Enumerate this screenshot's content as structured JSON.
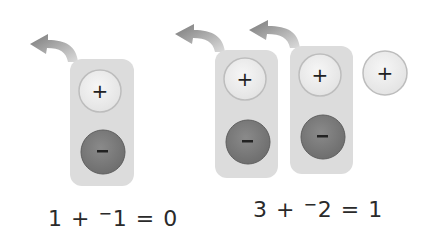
{
  "colors": {
    "background": "#ffffff",
    "pill": "#dcdcdc",
    "positive_counter": "#ededed",
    "positive_counter_edge": "#b8b8b8",
    "negative_counter": "#7d7d7d",
    "negative_counter_edge": "#5e5e5e",
    "arrow": "#8c8c8c",
    "text": "#2a2a2a"
  },
  "groups": [
    {
      "name": "left-model",
      "zero_pairs": 1,
      "extra_positive": 0,
      "equation": {
        "a": "1",
        "op": "+",
        "neg_sign": "−",
        "b": "1",
        "eq": "=",
        "result": "0"
      }
    },
    {
      "name": "right-model",
      "zero_pairs": 2,
      "extra_positive": 1,
      "equation": {
        "a": "3",
        "op": "+",
        "neg_sign": "−",
        "b": "2",
        "eq": "=",
        "result": "1"
      }
    }
  ],
  "counter_symbols": {
    "positive": "+",
    "negative": "−"
  }
}
